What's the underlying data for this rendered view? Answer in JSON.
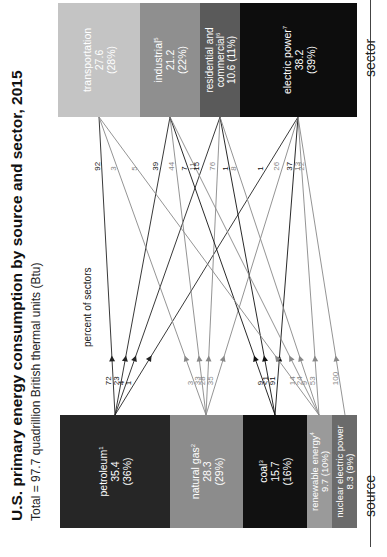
{
  "title": "U.S. primary energy consumption by source and sector, 2015",
  "subtitle": "Total = 97.7 quadrillion British thermal units (Btu)",
  "column_headers": {
    "sources": "percent of sources",
    "sectors": "percent of sectors"
  },
  "axis_labels": {
    "source": "source",
    "sector": "sector"
  },
  "sources": [
    {
      "id": "petroleum",
      "name": "petroleum",
      "footnote": "1",
      "value": "35.4",
      "percent": "(36%)",
      "color": "#262626"
    },
    {
      "id": "natural_gas",
      "name": "natural gas",
      "footnote": "2",
      "value": "28.3",
      "percent": "(29%)",
      "color": "#8c8c8c"
    },
    {
      "id": "coal",
      "name": "coal",
      "footnote": "3",
      "value": "15.7",
      "percent": "(16%)",
      "color": "#111111"
    },
    {
      "id": "renewable",
      "name": "renewable energy",
      "footnote": "4",
      "value": "9.7",
      "percent": "(10%)",
      "color": "#9a9a9a"
    },
    {
      "id": "nuclear",
      "name": "nuclear electric power",
      "footnote": "",
      "value": "8.3",
      "percent": "(9%)",
      "color": "#6b6b6b"
    }
  ],
  "sectors": [
    {
      "id": "transportation",
      "name": "transportation",
      "footnote": "",
      "value": "27.6",
      "percent": "(28%)",
      "color": "#c4c4c4"
    },
    {
      "id": "industrial",
      "name": "industrial",
      "footnote": "5",
      "value": "21.2",
      "percent": "(22%)",
      "color": "#8f8f8f"
    },
    {
      "id": "residential",
      "name": "residential and commercial",
      "footnote": "6",
      "value": "10.6",
      "percent": "(11%)",
      "color": "#5a5a5a"
    },
    {
      "id": "electric",
      "name": "electric power",
      "footnote": "7",
      "value": "38.2",
      "percent": "(39%)",
      "color": "#0d0d0d"
    }
  ],
  "source_flows": {
    "petroleum": [
      {
        "to": "transportation",
        "pct": "72"
      },
      {
        "to": "industrial",
        "pct": "23"
      },
      {
        "to": "residential",
        "pct": "4"
      },
      {
        "to": "electric",
        "pct": "1"
      }
    ],
    "natural_gas": [
      {
        "to": "transportation",
        "pct": "3"
      },
      {
        "to": "industrial",
        "pct": "33"
      },
      {
        "to": "residential",
        "pct": "28"
      },
      {
        "to": "electric",
        "pct": "35"
      }
    ],
    "coal": [
      {
        "to": "industrial",
        "pct": "9"
      },
      {
        "to": "residential",
        "pct": "<1"
      },
      {
        "to": "electric",
        "pct": "91"
      }
    ],
    "renewable": [
      {
        "to": "transportation",
        "pct": "14"
      },
      {
        "to": "industrial",
        "pct": "24"
      },
      {
        "to": "residential",
        "pct": "9"
      },
      {
        "to": "electric",
        "pct": "53"
      }
    ],
    "nuclear": [
      {
        "to": "electric",
        "pct": "100"
      }
    ]
  },
  "sector_flows": {
    "transportation": [
      {
        "from": "petroleum",
        "pct": "92"
      },
      {
        "from": "natural_gas",
        "pct": "3"
      },
      {
        "from": "renewable",
        "pct": "5"
      }
    ],
    "industrial": [
      {
        "from": "petroleum",
        "pct": "39"
      },
      {
        "from": "natural_gas",
        "pct": "44"
      },
      {
        "from": "coal",
        "pct": "7"
      },
      {
        "from": "renewable",
        "pct": "11"
      }
    ],
    "residential": [
      {
        "from": "petroleum",
        "pct": "15"
      },
      {
        "from": "natural_gas",
        "pct": "76"
      },
      {
        "from": "coal",
        "pct": "1"
      },
      {
        "from": "renewable",
        "pct": "8"
      }
    ],
    "electric": [
      {
        "from": "petroleum",
        "pct": "1"
      },
      {
        "from": "natural_gas",
        "pct": "26"
      },
      {
        "from": "coal",
        "pct": "37"
      },
      {
        "from": "renewable",
        "pct": "13"
      },
      {
        "from": "nuclear",
        "pct": "22"
      }
    ]
  },
  "chart_data": {
    "type": "flow",
    "title": "U.S. primary energy consumption by source and sector, 2015",
    "subtitle": "Total = 97.7 quadrillion British thermal units (Btu)",
    "units": "quadrillion Btu",
    "sources": [
      {
        "name": "petroleum",
        "value": 35.4,
        "share": 36
      },
      {
        "name": "natural gas",
        "value": 28.3,
        "share": 29
      },
      {
        "name": "coal",
        "value": 15.7,
        "share": 16
      },
      {
        "name": "renewable energy",
        "value": 9.7,
        "share": 10
      },
      {
        "name": "nuclear electric power",
        "value": 8.3,
        "share": 9
      }
    ],
    "sectors": [
      {
        "name": "transportation",
        "value": 27.6,
        "share": 28
      },
      {
        "name": "industrial",
        "value": 21.2,
        "share": 22
      },
      {
        "name": "residential and commercial",
        "value": 10.6,
        "share": 11
      },
      {
        "name": "electric power",
        "value": 38.2,
        "share": 39
      }
    ]
  }
}
